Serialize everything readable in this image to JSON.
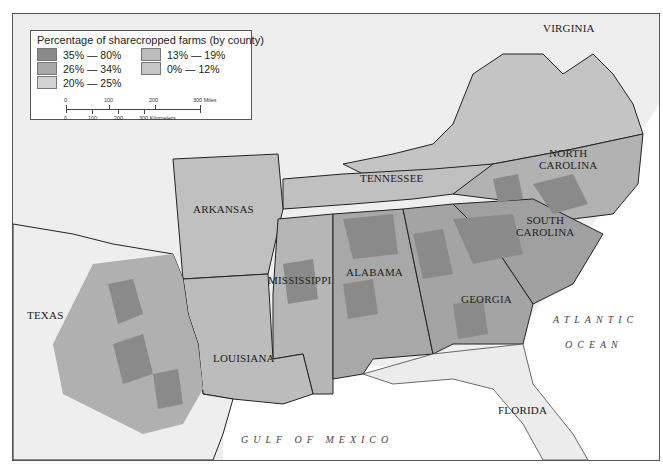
{
  "legend": {
    "title": "Percentage of sharecropped farms (by county)",
    "items": [
      {
        "label": "35% — 80%",
        "color": "#8a8a8a"
      },
      {
        "label": "26% — 34%",
        "color": "#a8a8a8"
      },
      {
        "label": "20% — 25%",
        "color": "#d2d2d2"
      },
      {
        "label": "13% — 19%",
        "color": "#bdbdbd"
      },
      {
        "label": "0% — 12%",
        "color": "#c6c6c6"
      }
    ],
    "scale": {
      "miles_ticks": [
        "0",
        "100",
        "200",
        "300 Miles"
      ],
      "km_ticks": [
        "0",
        "100",
        "200",
        "300 Kilometers"
      ]
    }
  },
  "states": [
    {
      "name": "VIRGINIA"
    },
    {
      "name": "NORTH CAROLINA",
      "line1": "NORTH",
      "line2": "CAROLINA"
    },
    {
      "name": "TENNESSEE"
    },
    {
      "name": "ARKANSAS"
    },
    {
      "name": "SOUTH CAROLINA",
      "line1": "SOUTH",
      "line2": "CAROLINA"
    },
    {
      "name": "MISSISSIPPI"
    },
    {
      "name": "ALABAMA"
    },
    {
      "name": "GEORGIA"
    },
    {
      "name": "TEXAS"
    },
    {
      "name": "LOUISIANA"
    },
    {
      "name": "FLORIDA"
    }
  ],
  "water": {
    "atlantic_line1": "ATLANTIC",
    "atlantic_line2": "OCEAN",
    "gulf": "GULF OF MEXICO"
  },
  "colors": {
    "water": "#ffffff",
    "land_outside": "#eeeeee",
    "border": "#222222"
  }
}
